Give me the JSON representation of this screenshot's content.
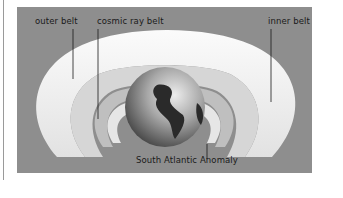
{
  "diagram": {
    "labels": {
      "outer_belt": "outer belt",
      "cosmic_ray_belt": "cosmic ray belt",
      "inner_belt": "inner belt",
      "south_atlantic_anomaly": "South Atlantic Anomaly"
    },
    "colors": {
      "background": "#8e8e8e",
      "outer_belt": "#f2f2f2",
      "inner_belt": "#d4d4d4",
      "cosmic_ray_belt": "#bdbdbd",
      "globe_ocean": "#9a9a9a",
      "globe_land": "#2a2a2a"
    }
  }
}
